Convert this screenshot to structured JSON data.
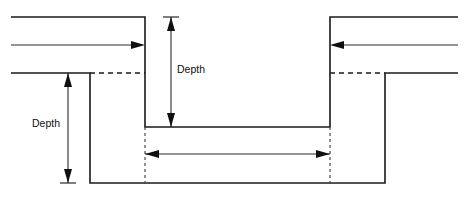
{
  "diagram": {
    "type": "engineering-cross-section",
    "background_color": "#ffffff",
    "line_color": "#1a1a1a",
    "labels": {
      "depth_upper": "Depth",
      "depth_lower": "Depth"
    },
    "annotations": {
      "upper_depth_label": "Depth",
      "lower_depth_label": "Depth"
    },
    "geometry": {
      "top_surface_y": 17,
      "second_surface_y": 73,
      "trench_floor_y": 127,
      "bottom_floor_y": 183,
      "left_start_x": 11,
      "left_step_x": 90,
      "left_wall_x": 145,
      "right_wall_x": 330,
      "right_step_x": 385,
      "right_end_x": 458,
      "flow_arrow_y": 45,
      "width_dim_y": 154,
      "upper_dim_x": 171,
      "lower_dim_x": 68
    }
  }
}
